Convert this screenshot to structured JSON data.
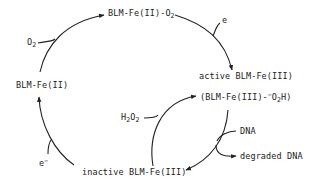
{
  "diagram": {
    "type": "reaction-cycle",
    "nodes": {
      "fe2": {
        "text": "BLM-Fe(II)"
      },
      "fe2o2": {
        "base": "BLM-Fe(II)-O",
        "sub": "2"
      },
      "active": {
        "text": "active BLM-Fe(III)"
      },
      "hydroperoxo": {
        "pre": "(BLM-Fe(III)-",
        "sup": "−",
        "mid": "O",
        "sub": "2",
        "post": "H)"
      },
      "inactive": {
        "text": "inactive BLM-Fe(III)"
      }
    },
    "reagents": {
      "o2": {
        "base": "O",
        "sub": "2"
      },
      "e1": {
        "text": "e"
      },
      "h2o2": {
        "a": "H",
        "sub1": "2",
        "b": "O",
        "sub2": "2"
      },
      "dna": {
        "text": "DNA"
      },
      "degraded": {
        "text": "degraded DNA"
      },
      "e2": {
        "base": "e",
        "sup": "−"
      }
    },
    "edges": [
      {
        "from": "BLM-Fe(II)",
        "to": "BLM-Fe(II)-O2",
        "reagent_in": "O2"
      },
      {
        "from": "BLM-Fe(II)-O2",
        "to": "active BLM-Fe(III)",
        "reagent_in": "e"
      },
      {
        "from": "inactive BLM-Fe(III)",
        "to": "(BLM-Fe(III)-⁻O2H)",
        "reagent_in": "H2O2"
      },
      {
        "from": "(BLM-Fe(III)-⁻O2H)",
        "to": "inactive BLM-Fe(III)",
        "reagent_in": "DNA",
        "product_out": "degraded DNA"
      },
      {
        "from": "inactive BLM-Fe(III)",
        "to": "BLM-Fe(II)",
        "reagent_in": "e-"
      }
    ],
    "colors": {
      "ink": "#222222",
      "background": "#ffffff"
    }
  }
}
